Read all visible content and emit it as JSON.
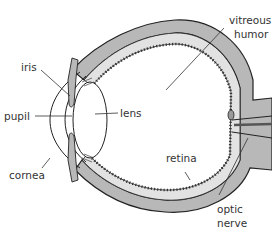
{
  "diagram": {
    "labels": {
      "iris": "iris",
      "pupil": "pupil",
      "lens": "lens",
      "cornea": "cornea",
      "vitreous_line1": "vitreous",
      "vitreous_line2": "humor",
      "retina": "retina",
      "optic_line1": "optic",
      "optic_line2": "nerve"
    },
    "colors": {
      "outline": "#222222",
      "sclera_fill": "#b8b8b8",
      "retina_fill": "#dcdcdc",
      "background": "#ffffff"
    }
  }
}
